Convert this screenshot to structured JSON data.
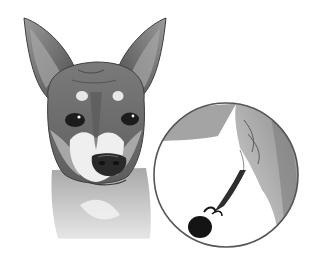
{
  "image": {
    "alt": "Grayscale illustration of a short-haired dog's head with a circular magnified inset showing a dark engorged tick attached to skin",
    "width": 317,
    "height": 270,
    "colors": {
      "background": "#ffffff",
      "fur_dark": "#5a5a5a",
      "fur_mid": "#8a8a8a",
      "fur_light": "#c8c8c8",
      "muzzle_white": "#f2f2f2",
      "nose": "#2a2a2a",
      "eye": "#1c1c1c",
      "inset_border": "#555555",
      "inset_skin": "#b0b0b0",
      "tick": "#141414"
    }
  }
}
